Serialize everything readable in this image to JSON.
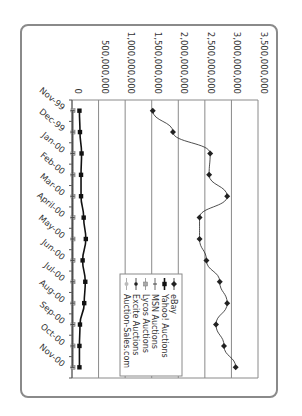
{
  "chart_data": {
    "type": "line",
    "orientation": "rotated-90-clockwise",
    "title": "",
    "xlabel": "",
    "ylabel": "",
    "categories": [
      "Nov-99",
      "Dec-99",
      "Jan-00",
      "Feb-00",
      "Mar-00",
      "April-00",
      "May-00",
      "Jun-00",
      "Jul-00",
      "Aug-00",
      "Sep-00",
      "Oct-00",
      "Nov-00"
    ],
    "y_ticks": [
      "0",
      "500,000,000",
      "1,000,000,000",
      "1,500,000,000",
      "2,000,000,000",
      "2,500,000,000",
      "3,000,000,000",
      "3,500,000,000"
    ],
    "ylim": [
      0,
      3500000000
    ],
    "grid": true,
    "legend_position": "inside-lower-center",
    "series": [
      {
        "name": "eBay",
        "marker": "diamond",
        "color": "#222222",
        "values": [
          1520000000,
          1900000000,
          2600000000,
          2580000000,
          2920000000,
          2400000000,
          2400000000,
          2530000000,
          2780000000,
          2920000000,
          2710000000,
          2860000000,
          3080000000
        ]
      },
      {
        "name": "Yahoo! Auctions",
        "marker": "square",
        "color": "#111111",
        "values": [
          140000000,
          150000000,
          180000000,
          170000000,
          170000000,
          220000000,
          260000000,
          200000000,
          250000000,
          230000000,
          150000000,
          140000000,
          140000000
        ]
      },
      {
        "name": "MSN Auctions",
        "marker": "dash",
        "color": "#444444",
        "values": [
          10000000,
          10000000,
          10000000,
          10000000,
          10000000,
          10000000,
          10000000,
          10000000,
          10000000,
          10000000,
          10000000,
          10000000,
          10000000
        ]
      },
      {
        "name": "Lycos Auctions",
        "marker": "square-gray",
        "color": "#888888",
        "values": [
          20000000,
          20000000,
          20000000,
          20000000,
          20000000,
          20000000,
          20000000,
          20000000,
          20000000,
          20000000,
          20000000,
          20000000,
          20000000
        ]
      },
      {
        "name": "Excite Auctions",
        "marker": "circle",
        "color": "#222222",
        "values": [
          15000000,
          15000000,
          15000000,
          15000000,
          15000000,
          15000000,
          15000000,
          15000000,
          15000000,
          15000000,
          15000000,
          15000000,
          15000000
        ]
      },
      {
        "name": "Auction-Sales.com",
        "marker": "circle-gray",
        "color": "#999999",
        "values": [
          5000000,
          5000000,
          5000000,
          5000000,
          5000000,
          5000000,
          5000000,
          5000000,
          5000000,
          5000000,
          5000000,
          5000000,
          5000000
        ]
      }
    ]
  },
  "legend": {
    "items": [
      "eBay",
      "Yahoo! Auctions",
      "MSN Auctions",
      "Lycos Auctions",
      "Excite Auctions",
      "Auction-Sales.com"
    ]
  }
}
